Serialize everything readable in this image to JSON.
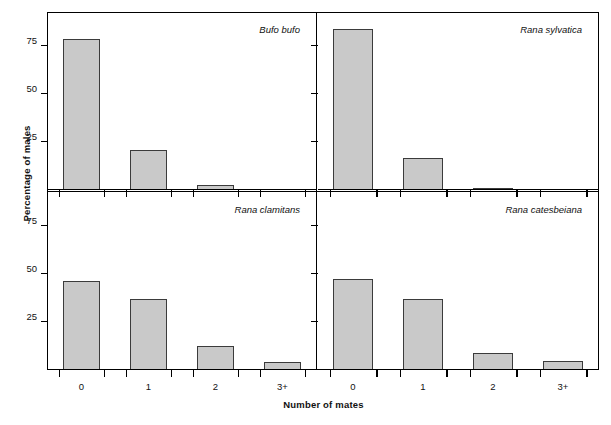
{
  "figure": {
    "ylabel": "Percentage of males",
    "xlabel": "Number of mates"
  },
  "axis": {
    "y_ticks": [
      "25",
      "50",
      "75"
    ],
    "x_ticks": [
      "0",
      "1",
      "2",
      "3+"
    ]
  },
  "chart_data": {
    "type": "bar",
    "title": "",
    "xlabel": "Number of mates",
    "ylabel": "Percentage of males",
    "categories": [
      "0",
      "1",
      "2",
      "3+"
    ],
    "ylim": [
      0,
      92
    ],
    "yticks": [
      25,
      50,
      75
    ],
    "grid": false,
    "legend": "none",
    "layout": "2x2 panel lattice, shared axes",
    "bar_fill": "#c9c9c9",
    "bar_edge": "#3b3b3b",
    "panels": [
      {
        "label": "Bufo bufo",
        "position": "top-left",
        "values": [
          78.5,
          21.0,
          2.5,
          0.0
        ]
      },
      {
        "label": "Rana sylvatica",
        "position": "top-right",
        "values": [
          83.5,
          16.5,
          1.0,
          0.0
        ]
      },
      {
        "label": "Rana clamitans",
        "position": "bottom-left",
        "values": [
          46.5,
          37.0,
          12.5,
          4.0
        ]
      },
      {
        "label": "Rana catesbeiana",
        "position": "bottom-right",
        "values": [
          47.5,
          37.0,
          9.0,
          4.5
        ]
      }
    ]
  }
}
